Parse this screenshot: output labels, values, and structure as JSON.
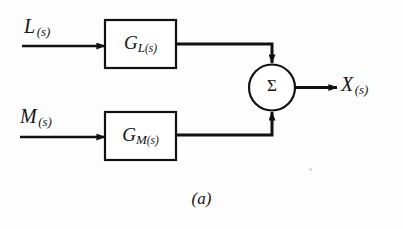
{
  "figure": {
    "caption": "(a)",
    "type": "block-diagram"
  },
  "signals": {
    "input_top": {
      "name": "L",
      "subscript": "(s)"
    },
    "input_bottom": {
      "name": "M",
      "subscript": "(s)"
    },
    "output": {
      "name": "X",
      "subscript": "(s)"
    }
  },
  "blocks": [
    {
      "id": "GL",
      "main": "G",
      "sub_var": "L",
      "sub_paren": "(s)",
      "label": "G_L(s)"
    },
    {
      "id": "GM",
      "main": "G",
      "sub_var": "M",
      "sub_paren": "(s)",
      "label": "G_M(s)"
    }
  ],
  "summing_junction": {
    "symbol": "Σ",
    "name": "summing-junction",
    "inputs": 2,
    "outputs": 1
  },
  "colors": {
    "line": "#111111",
    "text": "#141414",
    "background": "#fdfdfd"
  }
}
